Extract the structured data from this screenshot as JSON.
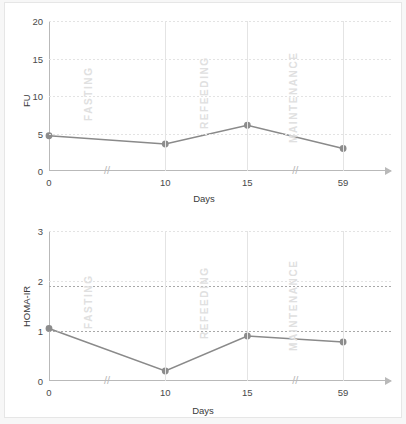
{
  "figure": {
    "background": "#ffffff",
    "line_color": "#8a8a8a",
    "marker_color": "#8c8c8c",
    "phase_color": "#e0e0e0"
  },
  "phases": [
    {
      "name": "FASTING"
    },
    {
      "name": "REFEEDING"
    },
    {
      "name": "MAINTENANCE"
    }
  ],
  "chart_data": [
    {
      "type": "line",
      "title": "",
      "xlabel": "Days",
      "ylabel": "FU",
      "x": [
        0,
        10,
        15,
        59
      ],
      "xtick_labels": [
        "0",
        "10",
        "15",
        "59"
      ],
      "values": [
        4.7,
        3.6,
        6.1,
        3.0
      ],
      "ylim": [
        0,
        20
      ],
      "yticks": [
        0,
        5,
        10,
        15,
        20
      ],
      "ytick_labels": [
        "0",
        "5",
        "10",
        "15",
        "20"
      ],
      "grid": true,
      "legend": "none",
      "axis_breaks": [
        "between 0 and 10",
        "between 15 and 59"
      ],
      "annotations": [
        "FASTING",
        "REFEEDING",
        "MAINTENANCE"
      ]
    },
    {
      "type": "line",
      "title": "",
      "xlabel": "Days",
      "ylabel": "HOMA-IR",
      "x": [
        0,
        10,
        15,
        59
      ],
      "xtick_labels": [
        "0",
        "10",
        "15",
        "59"
      ],
      "values": [
        1.05,
        0.2,
        0.9,
        0.78
      ],
      "ylim": [
        0,
        3
      ],
      "yticks": [
        0,
        1,
        2,
        3
      ],
      "ytick_labels": [
        "0",
        "1",
        "2",
        "3"
      ],
      "grid": true,
      "legend": "none",
      "axis_breaks": [
        "between 0 and 10",
        "between 15 and 59"
      ],
      "reference_lines": [
        1.0,
        1.9
      ],
      "annotations": [
        "FASTING",
        "REFEEDING",
        "MAINTENANCE"
      ]
    }
  ],
  "break_symbol": "//"
}
